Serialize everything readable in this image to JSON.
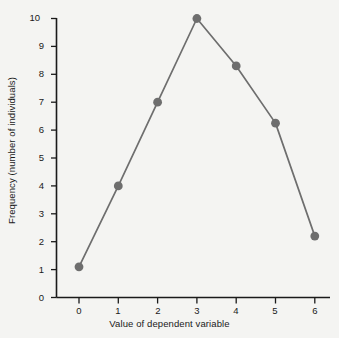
{
  "chart_data": {
    "type": "line",
    "title": "",
    "subtitle": "",
    "xlabel": "Value of dependent variable",
    "ylabel": "Frequency (number of individuals)",
    "x": [
      0,
      1,
      2,
      3,
      4,
      5,
      6
    ],
    "values": [
      1.1,
      4.0,
      7.0,
      10.0,
      8.3,
      6.25,
      2.2
    ],
    "series": [
      {
        "name": "Frequency",
        "values": [
          1.1,
          4.0,
          7.0,
          10.0,
          8.3,
          6.25,
          2.2
        ]
      }
    ],
    "xlim": [
      0,
      6
    ],
    "ylim": [
      0,
      10
    ],
    "xticks": [
      "0",
      "1",
      "2",
      "3",
      "4",
      "5",
      "6"
    ],
    "yticks": [
      "0",
      "1",
      "2",
      "3",
      "4",
      "5",
      "6",
      "7",
      "8",
      "9",
      "10"
    ],
    "grid": false,
    "legend": false,
    "legend_position": "none",
    "marker": "circle",
    "colors": {
      "line": "#6e6e6e",
      "marker": "#6e6e6e",
      "axis": "#1a1a1a",
      "text": "#1a1a1a",
      "background": "#f4f4f2"
    }
  }
}
